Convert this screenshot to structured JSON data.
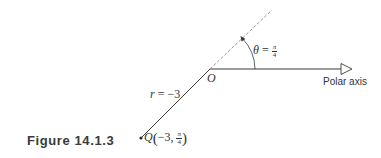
{
  "figure": {
    "caption": "Figure 14.1.3"
  },
  "diagram": {
    "origin_label": "O",
    "polar_axis_label": "Polar axis",
    "angle_label": {
      "symbol": "θ",
      "equals": "=",
      "numerator": "π",
      "denominator": "4"
    },
    "radius_label": {
      "symbol": "r",
      "equals": "=",
      "value": "−3"
    },
    "point_label": {
      "name": "Q",
      "r": "−3",
      "separator": ",",
      "theta_numerator": "π",
      "theta_denominator": "4"
    },
    "colors": {
      "line": "#3a3a3a",
      "dashed_ray": "#8a8a8a",
      "text": "#333333"
    }
  }
}
